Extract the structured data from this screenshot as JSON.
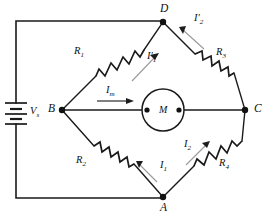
{
  "diagram": {
    "background_color": "#ffffff",
    "line_color": "#1a1a1a",
    "arrow_color": "#9a9a9a"
  },
  "nodes": [
    {
      "id": "D",
      "label": "D",
      "position": "top"
    },
    {
      "id": "B",
      "label": "B",
      "position": "left"
    },
    {
      "id": "C",
      "label": "C",
      "position": "right"
    },
    {
      "id": "A",
      "label": "A",
      "position": "bottom"
    }
  ],
  "components": {
    "source": {
      "name": "battery",
      "label": "V",
      "sublabel": "s",
      "symbol": "multi-cell-battery"
    },
    "meter": {
      "name": "galvanometer",
      "label": "M",
      "symbol": "circle-meter"
    },
    "resistors": [
      {
        "id": "R1",
        "label": "R",
        "sublabel": "1",
        "branch": "B-D"
      },
      {
        "id": "R3",
        "label": "R",
        "sublabel": "3",
        "branch": "D-C"
      },
      {
        "id": "R2",
        "label": "R",
        "sublabel": "2",
        "branch": "B-A"
      },
      {
        "id": "R4",
        "label": "R",
        "sublabel": "4",
        "branch": "A-C"
      }
    ]
  },
  "currents": [
    {
      "id": "I1p",
      "label": "I",
      "prime": "′",
      "sublabel": "1",
      "branch": "B-D",
      "direction": "toward-D"
    },
    {
      "id": "I2p",
      "label": "I",
      "prime": "′",
      "sublabel": "2",
      "branch": "D-C",
      "direction": "toward-D"
    },
    {
      "id": "Im",
      "label": "I",
      "prime": "",
      "sublabel": "m",
      "branch": "B-M",
      "direction": "toward-C"
    },
    {
      "id": "I1",
      "label": "I",
      "prime": "",
      "sublabel": "1",
      "branch": "B-A",
      "direction": "toward-B"
    },
    {
      "id": "I2",
      "label": "I",
      "prime": "",
      "sublabel": "2",
      "branch": "A-C",
      "direction": "toward-C"
    }
  ]
}
